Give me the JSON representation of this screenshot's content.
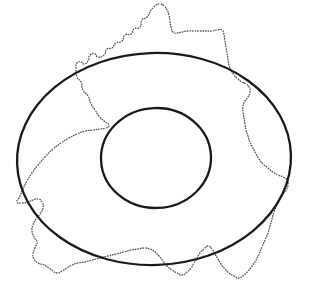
{
  "figure": {
    "type": "geometric-diagram",
    "canvas": {
      "width": 309,
      "height": 287,
      "background": "#ffffff"
    },
    "colors": {
      "solid_stroke": "#1a1a1a",
      "dotted_stroke": "#565656",
      "background": "#ffffff"
    },
    "shapes": {
      "outer_ellipse": {
        "name": "outer-ellipse",
        "style": "solid",
        "stroke": "#1a1a1a",
        "stroke_width": 2.3,
        "center_x": 154,
        "center_y": 159,
        "radius_x": 137,
        "radius_y": 106,
        "rotation_deg": -2,
        "bounds": {
          "left": 17,
          "right": 291,
          "top": 53,
          "bottom": 265
        }
      },
      "inner_ellipse": {
        "name": "inner-ellipse",
        "style": "solid",
        "stroke": "#1a1a1a",
        "stroke_width": 2.3,
        "center_x": 156,
        "center_y": 158,
        "radius_x": 55,
        "radius_y": 50,
        "rotation_deg": -2,
        "bounds": {
          "left": 101,
          "right": 211,
          "top": 108,
          "bottom": 208
        }
      },
      "dotted_boundary": {
        "name": "dotted-boundary-outline",
        "style": "dotted",
        "stroke": "#565656",
        "stroke_width": 1.35,
        "dash_pattern": "0.6 2.0",
        "closed": true,
        "description": "Irregular closed polyline resembling a national border outline, crossing both ellipses",
        "points": [
          [
            151,
            10
          ],
          [
            147,
            17
          ],
          [
            142,
            20
          ],
          [
            140,
            27
          ],
          [
            134,
            29
          ],
          [
            131,
            34
          ],
          [
            125,
            35
          ],
          [
            122,
            41
          ],
          [
            116,
            43
          ],
          [
            112,
            48
          ],
          [
            107,
            49
          ],
          [
            104,
            55
          ],
          [
            98,
            57
          ],
          [
            95,
            54
          ],
          [
            90,
            55
          ],
          [
            88,
            61
          ],
          [
            84,
            64
          ],
          [
            81,
            62
          ],
          [
            77,
            63
          ],
          [
            76,
            69
          ],
          [
            77,
            77
          ],
          [
            81,
            82
          ],
          [
            83,
            90
          ],
          [
            88,
            96
          ],
          [
            91,
            104
          ],
          [
            95,
            110
          ],
          [
            99,
            116
          ],
          [
            104,
            121
          ],
          [
            109,
            125
          ],
          [
            106,
            128
          ],
          [
            100,
            129
          ],
          [
            93,
            130
          ],
          [
            85,
            131
          ],
          [
            77,
            134
          ],
          [
            69,
            138
          ],
          [
            61,
            143
          ],
          [
            53,
            149
          ],
          [
            45,
            157
          ],
          [
            38,
            165
          ],
          [
            32,
            173
          ],
          [
            27,
            181
          ],
          [
            23,
            189
          ],
          [
            20,
            196
          ],
          [
            17,
            202
          ],
          [
            22,
            203
          ],
          [
            28,
            202
          ],
          [
            33,
            200
          ],
          [
            38,
            199
          ],
          [
            42,
            202
          ],
          [
            43,
            208
          ],
          [
            40,
            214
          ],
          [
            36,
            219
          ],
          [
            33,
            225
          ],
          [
            32,
            231
          ],
          [
            34,
            237
          ],
          [
            37,
            242
          ],
          [
            35,
            248
          ],
          [
            33,
            254
          ],
          [
            34,
            259
          ],
          [
            38,
            263
          ],
          [
            44,
            265
          ],
          [
            49,
            268
          ],
          [
            53,
            271
          ],
          [
            57,
            273
          ],
          [
            62,
            271
          ],
          [
            67,
            268
          ],
          [
            72,
            265
          ],
          [
            78,
            263
          ],
          [
            85,
            262
          ],
          [
            92,
            260
          ],
          [
            100,
            258
          ],
          [
            108,
            256
          ],
          [
            116,
            254
          ],
          [
            124,
            252
          ],
          [
            131,
            250
          ],
          [
            138,
            249
          ],
          [
            144,
            248
          ],
          [
            150,
            249
          ],
          [
            155,
            252
          ],
          [
            159,
            256
          ],
          [
            163,
            261
          ],
          [
            167,
            266
          ],
          [
            172,
            270
          ],
          [
            177,
            273
          ],
          [
            182,
            275
          ],
          [
            187,
            272
          ],
          [
            191,
            268
          ],
          [
            194,
            263
          ],
          [
            197,
            258
          ],
          [
            200,
            253
          ],
          [
            204,
            249
          ],
          [
            208,
            246
          ],
          [
            212,
            249
          ],
          [
            215,
            254
          ],
          [
            218,
            259
          ],
          [
            221,
            264
          ],
          [
            225,
            269
          ],
          [
            229,
            273
          ],
          [
            234,
            276
          ],
          [
            239,
            278
          ],
          [
            244,
            275
          ],
          [
            248,
            271
          ],
          [
            252,
            266
          ],
          [
            256,
            260
          ],
          [
            259,
            254
          ],
          [
            262,
            247
          ],
          [
            265,
            240
          ],
          [
            268,
            233
          ],
          [
            270,
            226
          ],
          [
            272,
            219
          ],
          [
            274,
            212
          ],
          [
            277,
            205
          ],
          [
            280,
            199
          ],
          [
            283,
            194
          ],
          [
            286,
            190
          ],
          [
            288,
            185
          ],
          [
            287,
            180
          ],
          [
            283,
            177
          ],
          [
            278,
            175
          ],
          [
            273,
            172
          ],
          [
            268,
            168
          ],
          [
            263,
            164
          ],
          [
            259,
            159
          ],
          [
            256,
            154
          ],
          [
            253,
            148
          ],
          [
            250,
            142
          ],
          [
            248,
            136
          ],
          [
            246,
            130
          ],
          [
            245,
            124
          ],
          [
            244,
            118
          ],
          [
            243,
            112
          ],
          [
            243,
            106
          ],
          [
            245,
            101
          ],
          [
            248,
            97
          ],
          [
            250,
            92
          ],
          [
            249,
            87
          ],
          [
            246,
            84
          ],
          [
            242,
            82
          ],
          [
            238,
            79
          ],
          [
            234,
            75
          ],
          [
            231,
            70
          ],
          [
            229,
            65
          ],
          [
            228,
            59
          ],
          [
            227,
            53
          ],
          [
            226,
            47
          ],
          [
            225,
            41
          ],
          [
            224,
            35
          ],
          [
            222,
            30
          ],
          [
            217,
            30
          ],
          [
            212,
            31
          ],
          [
            206,
            31
          ],
          [
            200,
            31
          ],
          [
            194,
            31
          ],
          [
            188,
            31
          ],
          [
            182,
            32
          ],
          [
            177,
            33
          ],
          [
            173,
            32
          ],
          [
            171,
            27
          ],
          [
            170,
            21
          ],
          [
            169,
            15
          ],
          [
            167,
            10
          ],
          [
            164,
            6
          ],
          [
            160,
            4
          ],
          [
            156,
            5
          ],
          [
            153,
            8
          ]
        ]
      }
    }
  }
}
